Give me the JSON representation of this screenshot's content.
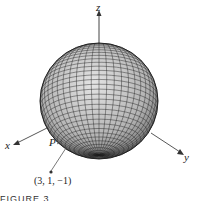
{
  "figure": {
    "axes": {
      "x_label": "x",
      "y_label": "y",
      "z_label": "z"
    },
    "point_label": "P",
    "point_coords": "(3, 1, −1)",
    "caption": "FIGURE 3",
    "colors": {
      "sphere_fill": "#b8b8b8",
      "grid": "#222222",
      "axis": "#444444"
    }
  }
}
